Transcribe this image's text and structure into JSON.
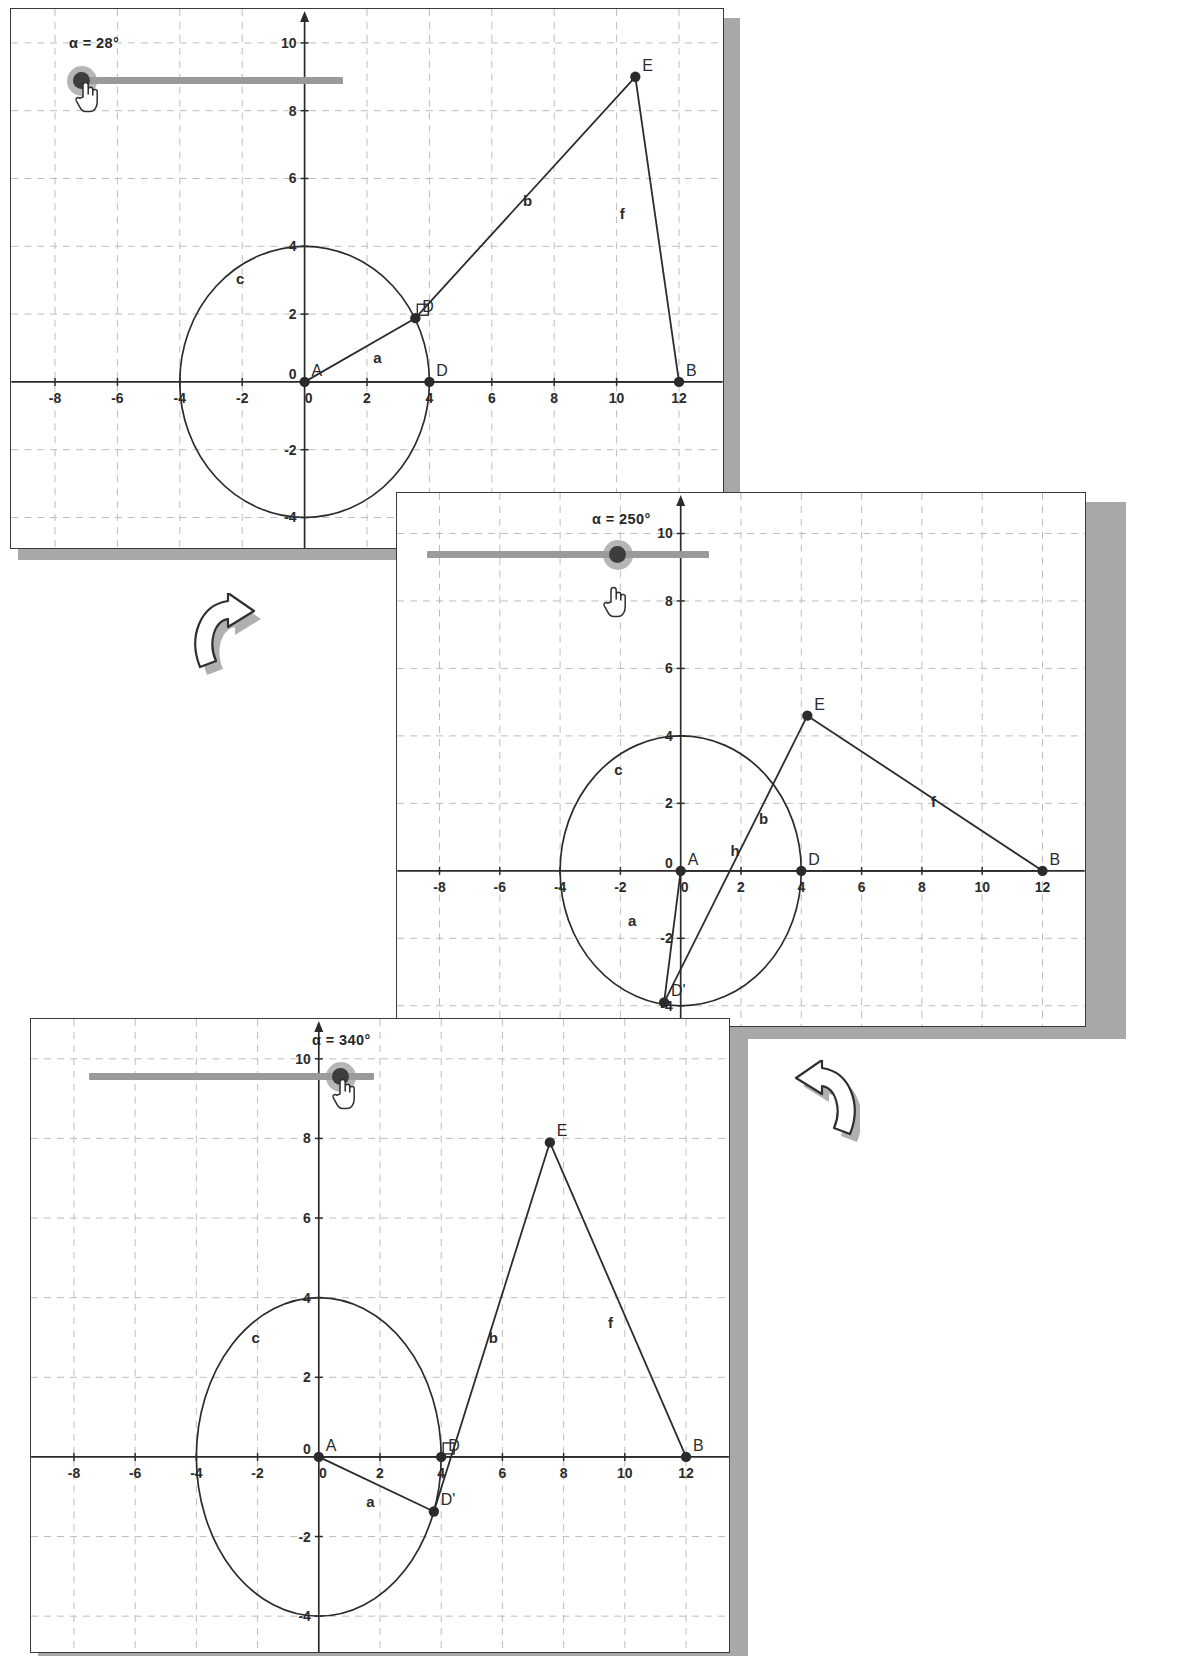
{
  "document": {
    "kind": "geometry-worksheet-figure",
    "description": "Three stacked GeoGebra screenshots of the same construction at three slider values, linked by curved arrows."
  },
  "cut_off_header": "· ·     ·       · ·",
  "arrows": [
    {
      "name": "arrow-panel1-to-panel2",
      "direction": "down-right"
    },
    {
      "name": "arrow-panel2-to-panel3",
      "direction": "down-left"
    }
  ],
  "panels": [
    {
      "id": "panel-1",
      "slider": {
        "label": "α = 28°",
        "value": 28,
        "unit": "°",
        "min": 0,
        "max": 360,
        "handle_position_fraction": 0.02,
        "cursor": "hand-pointer"
      },
      "axes": {
        "x_ticks": [
          -8,
          -6,
          -4,
          -2,
          0,
          2,
          4,
          6,
          8,
          10,
          12
        ],
        "y_ticks": [
          -4,
          -2,
          0,
          2,
          4,
          6,
          8,
          10
        ],
        "origin_label": "0",
        "grid": "dashed",
        "x_range": [
          -9.4,
          13.4
        ],
        "y_range": [
          -4.9,
          11.0
        ]
      },
      "points": [
        {
          "label": "A",
          "x": 0,
          "y": 0
        },
        {
          "label": "D",
          "x": 4,
          "y": 0
        },
        {
          "label": "D'",
          "x": 3.55,
          "y": 1.88,
          "label_shown": "D"
        },
        {
          "label": "E",
          "x": 10.6,
          "y": 9.0
        },
        {
          "label": "B",
          "x": 12,
          "y": 0
        }
      ],
      "segments": [
        {
          "name": "a",
          "from": "A",
          "to": "D'",
          "label": "a",
          "label_x": 2.2,
          "label_y": 0.55
        },
        {
          "name": "b",
          "from": "D'",
          "to": "E",
          "label": "b",
          "label_x": 7.0,
          "label_y": 5.2
        },
        {
          "name": "f",
          "from": "E",
          "to": "B",
          "label": "f",
          "label_x": 10.1,
          "label_y": 4.8
        },
        {
          "name": "x-axis-base",
          "from": "A",
          "to": "B",
          "label": "",
          "label_x": 0,
          "label_y": 0
        }
      ],
      "circle": {
        "label": "c",
        "center_x": 0,
        "center_y": 0,
        "radius": 4,
        "label_x": -2.2,
        "label_y": 2.9
      },
      "right_angle_marker": {
        "at": "D'",
        "shown": true
      }
    },
    {
      "id": "panel-2",
      "slider": {
        "label": "α = 250°",
        "value": 250,
        "unit": "°",
        "min": 0,
        "max": 360,
        "handle_position_fraction": 0.69,
        "cursor": "hand-pointer"
      },
      "axes": {
        "x_ticks": [
          -8,
          -6,
          -4,
          -2,
          0,
          2,
          4,
          6,
          8,
          10,
          12
        ],
        "y_ticks": [
          -4,
          -2,
          0,
          2,
          4,
          6,
          8,
          10
        ],
        "origin_label": "0",
        "grid": "dashed",
        "x_range": [
          -9.4,
          13.4
        ],
        "y_range": [
          -4.6,
          11.2
        ]
      },
      "points": [
        {
          "label": "A",
          "x": 0,
          "y": 0
        },
        {
          "label": "D",
          "x": 4,
          "y": 0
        },
        {
          "label": "D'",
          "x": -0.55,
          "y": -3.9
        },
        {
          "label": "E",
          "x": 4.2,
          "y": 4.6
        },
        {
          "label": "B",
          "x": 12,
          "y": 0
        }
      ],
      "segments": [
        {
          "name": "a",
          "from": "A",
          "to": "D'",
          "label": "a",
          "label_x": -1.75,
          "label_y": -1.65
        },
        {
          "name": "b",
          "from": "D'",
          "to": "E",
          "label": "b",
          "label_x": 2.6,
          "label_y": 1.4
        },
        {
          "name": "f",
          "from": "E",
          "to": "B",
          "label": "f",
          "label_x": 8.3,
          "label_y": 1.9
        },
        {
          "name": "h",
          "from": "A",
          "to": "B",
          "label": "h",
          "label_x": 1.65,
          "label_y": 0.45
        }
      ],
      "circle": {
        "label": "c",
        "center_x": 0,
        "center_y": 0,
        "radius": 4,
        "label_x": -2.2,
        "label_y": 2.85
      },
      "right_angle_marker": {
        "at": "D'",
        "shown": false
      }
    },
    {
      "id": "panel-3",
      "slider": {
        "label": "α = 340°",
        "value": 340,
        "unit": "°",
        "min": 0,
        "max": 360,
        "handle_position_fraction": 0.945,
        "cursor": "hand-pointer"
      },
      "axes": {
        "x_ticks": [
          -8,
          -6,
          -4,
          -2,
          0,
          2,
          4,
          6,
          8,
          10,
          12
        ],
        "y_ticks": [
          -4,
          -2,
          0,
          2,
          4,
          6,
          8,
          10
        ],
        "origin_label": "0",
        "grid": "dashed",
        "x_range": [
          -9.4,
          13.4
        ],
        "y_range": [
          -4.9,
          11.0
        ]
      },
      "points": [
        {
          "label": "A",
          "x": 0,
          "y": 0
        },
        {
          "label": "D",
          "x": 4,
          "y": 0
        },
        {
          "label": "D'",
          "x": 3.76,
          "y": -1.37
        },
        {
          "label": "E",
          "x": 7.55,
          "y": 7.9
        },
        {
          "label": "B",
          "x": 12,
          "y": 0
        }
      ],
      "segments": [
        {
          "name": "a",
          "from": "A",
          "to": "D'",
          "label": "a",
          "label_x": 1.55,
          "label_y": -1.25
        },
        {
          "name": "b",
          "from": "D'",
          "to": "E",
          "label": "b",
          "label_x": 5.55,
          "label_y": 2.85
        },
        {
          "name": "f",
          "from": "E",
          "to": "B",
          "label": "f",
          "label_x": 9.45,
          "label_y": 3.25
        },
        {
          "name": "x-axis-base",
          "from": "A",
          "to": "B",
          "label": "",
          "label_x": 0,
          "label_y": 0
        }
      ],
      "circle": {
        "label": "c",
        "center_x": 0,
        "center_y": 0,
        "radius": 4,
        "label_x": -2.2,
        "label_y": 2.85
      },
      "right_angle_marker": {
        "at": "D",
        "shown": true
      }
    }
  ],
  "colors": {
    "ink": "#2b2b2b",
    "frame": "#3a3a3a",
    "grid": "#bdbdbd",
    "slider_track": "#9a9a9a",
    "slider_knob": "#3d3d3d",
    "shadow": "#a8a8a8",
    "arrow_fill": "#b0b0b0"
  }
}
